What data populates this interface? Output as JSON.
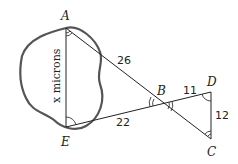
{
  "diagram": {
    "points": {
      "A": "A",
      "B": "B",
      "C": "C",
      "D": "D",
      "E": "E"
    },
    "segments": {
      "AB": "26",
      "EB": "22",
      "BD": "11",
      "DC": "12",
      "AE": "x microns"
    }
  }
}
